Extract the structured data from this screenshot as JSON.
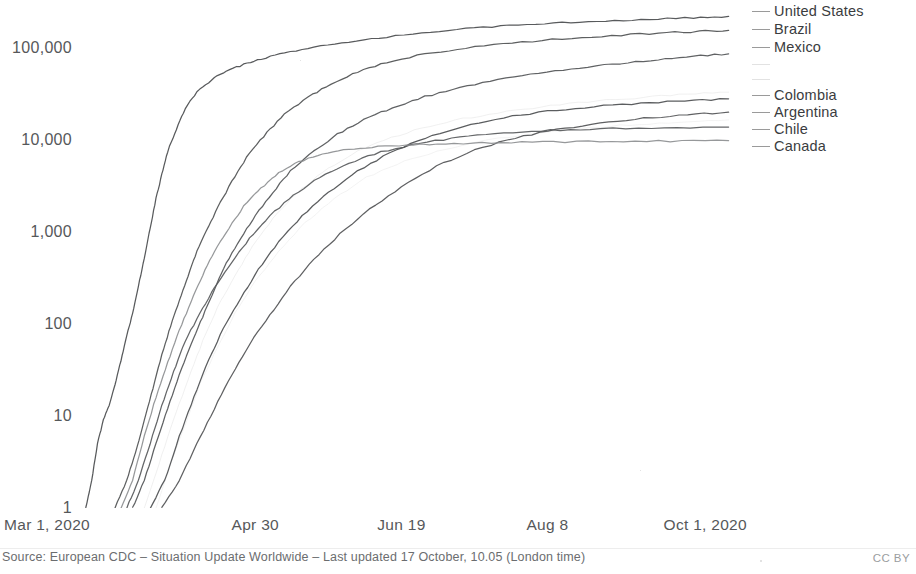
{
  "chart_data": {
    "type": "line",
    "title": "",
    "subtitle": "",
    "xlabel": "",
    "ylabel": "",
    "yscale": "log",
    "ylim": [
      1,
      300000
    ],
    "grid": false,
    "legend_position": "right",
    "y_ticks": [
      {
        "value": 1,
        "label": "1"
      },
      {
        "value": 10,
        "label": "10"
      },
      {
        "value": 100,
        "label": "100"
      },
      {
        "value": 1000,
        "label": "1,000"
      },
      {
        "value": 10000,
        "label": "10,000"
      },
      {
        "value": 100000,
        "label": "100,000"
      }
    ],
    "x_ticks": [
      {
        "day": 0,
        "label": "Mar 1, 2020"
      },
      {
        "day": 60,
        "label": "Apr 30"
      },
      {
        "day": 110,
        "label": "Jun 19"
      },
      {
        "day": 160,
        "label": "Aug 8"
      },
      {
        "day": 214,
        "label": "Oct 1, 2020"
      }
    ],
    "x_range": [
      0,
      230
    ],
    "series": [
      {
        "name": "United States",
        "color": "#4a4c4e",
        "end_value": 220000,
        "points": [
          [
            2,
            1
          ],
          [
            4,
            2
          ],
          [
            6,
            5
          ],
          [
            8,
            9
          ],
          [
            10,
            13
          ],
          [
            12,
            22
          ],
          [
            14,
            40
          ],
          [
            16,
            75
          ],
          [
            18,
            130
          ],
          [
            20,
            260
          ],
          [
            22,
            520
          ],
          [
            24,
            1100
          ],
          [
            26,
            2300
          ],
          [
            28,
            4200
          ],
          [
            30,
            7500
          ],
          [
            33,
            13000
          ],
          [
            36,
            22000
          ],
          [
            40,
            33000
          ],
          [
            45,
            45000
          ],
          [
            50,
            56000
          ],
          [
            56,
            66000
          ],
          [
            62,
            76000
          ],
          [
            70,
            88000
          ],
          [
            80,
            101000
          ],
          [
            92,
            116000
          ],
          [
            105,
            132000
          ],
          [
            120,
            150000
          ],
          [
            135,
            165000
          ],
          [
            150,
            177000
          ],
          [
            165,
            188000
          ],
          [
            180,
            197000
          ],
          [
            195,
            205000
          ],
          [
            210,
            213000
          ],
          [
            222,
            220000
          ]
        ]
      },
      {
        "name": "Brazil",
        "color": "#4f5153",
        "end_value": 155000,
        "points": [
          [
            12,
            1
          ],
          [
            16,
            2
          ],
          [
            19,
            4
          ],
          [
            22,
            9
          ],
          [
            25,
            20
          ],
          [
            28,
            46
          ],
          [
            31,
            95
          ],
          [
            34,
            180
          ],
          [
            37,
            330
          ],
          [
            40,
            620
          ],
          [
            44,
            1150
          ],
          [
            48,
            2100
          ],
          [
            53,
            4000
          ],
          [
            58,
            7200
          ],
          [
            64,
            12000
          ],
          [
            70,
            19000
          ],
          [
            78,
            29000
          ],
          [
            86,
            41000
          ],
          [
            95,
            55000
          ],
          [
            105,
            70000
          ],
          [
            118,
            86000
          ],
          [
            132,
            100000
          ],
          [
            148,
            113000
          ],
          [
            165,
            126000
          ],
          [
            182,
            136000
          ],
          [
            198,
            145000
          ],
          [
            212,
            151000
          ],
          [
            222,
            155000
          ]
        ]
      },
      {
        "name": "Mexico",
        "color": "#535557",
        "end_value": 86000,
        "points": [
          [
            18,
            1
          ],
          [
            22,
            2
          ],
          [
            26,
            5
          ],
          [
            30,
            12
          ],
          [
            34,
            28
          ],
          [
            38,
            60
          ],
          [
            42,
            120
          ],
          [
            46,
            240
          ],
          [
            50,
            450
          ],
          [
            55,
            850
          ],
          [
            60,
            1500
          ],
          [
            66,
            2700
          ],
          [
            72,
            4600
          ],
          [
            80,
            7600
          ],
          [
            88,
            11500
          ],
          [
            97,
            16500
          ],
          [
            107,
            22500
          ],
          [
            118,
            29500
          ],
          [
            130,
            37000
          ],
          [
            143,
            45000
          ],
          [
            157,
            53000
          ],
          [
            171,
            61000
          ],
          [
            185,
            68000
          ],
          [
            198,
            75000
          ],
          [
            210,
            81000
          ],
          [
            222,
            86000
          ]
        ]
      },
      {
        "name": "",
        "color": "#d5d5d5",
        "end_value": 33000,
        "faded": true,
        "points": [
          [
            22,
            1
          ],
          [
            27,
            3
          ],
          [
            32,
            9
          ],
          [
            37,
            25
          ],
          [
            42,
            65
          ],
          [
            47,
            150
          ],
          [
            53,
            330
          ],
          [
            59,
            700
          ],
          [
            66,
            1400
          ],
          [
            74,
            2600
          ],
          [
            83,
            4500
          ],
          [
            93,
            7000
          ],
          [
            104,
            10000
          ],
          [
            117,
            13500
          ],
          [
            131,
            17000
          ],
          [
            146,
            20500
          ],
          [
            161,
            23500
          ],
          [
            177,
            26500
          ],
          [
            193,
            29000
          ],
          [
            208,
            31500
          ],
          [
            222,
            33000
          ]
        ]
      },
      {
        "name": "",
        "color": "#dcdcdc",
        "end_value": 16500,
        "faded": true,
        "points": [
          [
            26,
            1
          ],
          [
            31,
            3
          ],
          [
            36,
            8
          ],
          [
            41,
            22
          ],
          [
            47,
            55
          ],
          [
            53,
            130
          ],
          [
            60,
            290
          ],
          [
            68,
            620
          ],
          [
            77,
            1250
          ],
          [
            87,
            2300
          ],
          [
            98,
            3900
          ],
          [
            111,
            5900
          ],
          [
            125,
            8000
          ],
          [
            140,
            10000
          ],
          [
            156,
            11800
          ],
          [
            172,
            13300
          ],
          [
            188,
            14600
          ],
          [
            205,
            15700
          ],
          [
            222,
            16500
          ]
        ]
      },
      {
        "name": "Colombia",
        "color": "#4d4f51",
        "end_value": 28000,
        "points": [
          [
            24,
            1
          ],
          [
            29,
            2
          ],
          [
            34,
            6
          ],
          [
            39,
            16
          ],
          [
            44,
            40
          ],
          [
            49,
            90
          ],
          [
            55,
            190
          ],
          [
            61,
            390
          ],
          [
            68,
            780
          ],
          [
            76,
            1500
          ],
          [
            85,
            2700
          ],
          [
            95,
            4600
          ],
          [
            106,
            7200
          ],
          [
            118,
            10500
          ],
          [
            131,
            14000
          ],
          [
            145,
            17500
          ],
          [
            160,
            20500
          ],
          [
            176,
            23000
          ],
          [
            192,
            25000
          ],
          [
            207,
            26800
          ],
          [
            222,
            28000
          ]
        ]
      },
      {
        "name": "Argentina",
        "color": "#515355",
        "end_value": 20000,
        "points": [
          [
            28,
            1
          ],
          [
            34,
            2
          ],
          [
            40,
            5
          ],
          [
            46,
            12
          ],
          [
            52,
            28
          ],
          [
            58,
            60
          ],
          [
            65,
            125
          ],
          [
            72,
            255
          ],
          [
            80,
            500
          ],
          [
            89,
            950
          ],
          [
            99,
            1750
          ],
          [
            110,
            3100
          ],
          [
            122,
            5200
          ],
          [
            135,
            7800
          ],
          [
            149,
            10500
          ],
          [
            163,
            13000
          ],
          [
            178,
            15300
          ],
          [
            193,
            17200
          ],
          [
            208,
            18800
          ],
          [
            222,
            20000
          ]
        ]
      },
      {
        "name": "Chile",
        "color": "#57595b",
        "end_value": 13800,
        "points": [
          [
            16,
            1
          ],
          [
            20,
            2
          ],
          [
            24,
            5
          ],
          [
            28,
            13
          ],
          [
            32,
            30
          ],
          [
            36,
            65
          ],
          [
            41,
            130
          ],
          [
            46,
            250
          ],
          [
            52,
            470
          ],
          [
            58,
            850
          ],
          [
            65,
            1500
          ],
          [
            73,
            2500
          ],
          [
            82,
            3900
          ],
          [
            92,
            5600
          ],
          [
            103,
            7400
          ],
          [
            116,
            9200
          ],
          [
            130,
            10700
          ],
          [
            145,
            11900
          ],
          [
            161,
            12700
          ],
          [
            178,
            13200
          ],
          [
            200,
            13600
          ],
          [
            222,
            13800
          ]
        ]
      },
      {
        "name": "Canada",
        "color": "#8d8f91",
        "end_value": 9800,
        "points": [
          [
            14,
            1
          ],
          [
            18,
            2
          ],
          [
            22,
            6
          ],
          [
            26,
            16
          ],
          [
            30,
            38
          ],
          [
            34,
            85
          ],
          [
            38,
            175
          ],
          [
            42,
            340
          ],
          [
            46,
            620
          ],
          [
            51,
            1100
          ],
          [
            56,
            1900
          ],
          [
            62,
            3000
          ],
          [
            68,
            4400
          ],
          [
            75,
            5800
          ],
          [
            83,
            7000
          ],
          [
            92,
            7900
          ],
          [
            102,
            8500
          ],
          [
            114,
            8900
          ],
          [
            128,
            9150
          ],
          [
            144,
            9350
          ],
          [
            162,
            9500
          ],
          [
            182,
            9620
          ],
          [
            202,
            9720
          ],
          [
            222,
            9800
          ]
        ]
      }
    ],
    "legend": [
      {
        "label": "United States",
        "faded": false,
        "y": 11
      },
      {
        "label": "Brazil",
        "faded": false,
        "y": 29
      },
      {
        "label": "Mexico",
        "faded": false,
        "y": 47
      },
      {
        "label": "",
        "faded": true,
        "y": 64
      },
      {
        "label": "",
        "faded": true,
        "y": 79
      },
      {
        "label": "Colombia",
        "faded": false,
        "y": 95
      },
      {
        "label": "Argentina",
        "faded": false,
        "y": 112
      },
      {
        "label": "Chile",
        "faded": false,
        "y": 129
      },
      {
        "label": "Canada",
        "faded": false,
        "y": 146
      }
    ]
  },
  "footer": {
    "source": "Source: European CDC – Situation Update Worldwide – Last updated 17 October, 10.05 (London time)",
    "license": "CC BY"
  }
}
